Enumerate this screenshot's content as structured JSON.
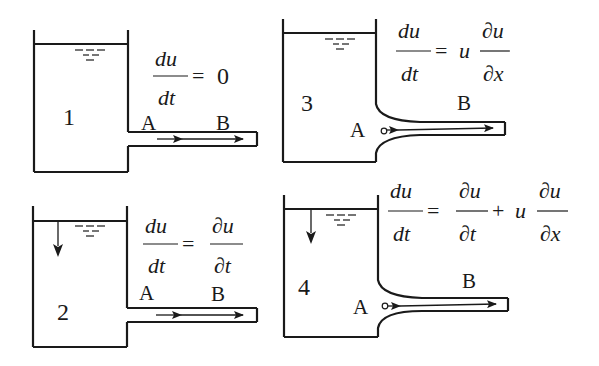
{
  "diagrams": [
    {
      "number": "1",
      "label_a": "A",
      "label_b": "B",
      "equation": {
        "lhs_num": "du",
        "lhs_den": "dt",
        "equals": "=",
        "rhs": "0"
      },
      "tank_level": "constant",
      "pipe": "uniform"
    },
    {
      "number": "2",
      "label_a": "A",
      "label_b": "B",
      "equation": {
        "lhs_num": "du",
        "lhs_den": "dt",
        "equals": "=",
        "rhs_num": "∂u",
        "rhs_den": "∂t"
      },
      "tank_level": "falling",
      "pipe": "uniform"
    },
    {
      "number": "3",
      "label_a": "A",
      "label_b": "B",
      "equation": {
        "lhs_num": "du",
        "lhs_den": "dt",
        "equals": "=",
        "coef": "u",
        "rhs_num": "∂u",
        "rhs_den": "∂x"
      },
      "tank_level": "constant",
      "pipe": "converging"
    },
    {
      "number": "4",
      "label_a": "A",
      "label_b": "B",
      "equation": {
        "lhs_num": "du",
        "lhs_den": "dt",
        "equals": "=",
        "rhs1_num": "∂u",
        "rhs1_den": "∂t",
        "plus": "+",
        "coef": "u",
        "rhs2_num": "∂u",
        "rhs2_den": "∂x"
      },
      "tank_level": "falling",
      "pipe": "converging"
    }
  ],
  "colors": {
    "stroke": "#1a1a1a",
    "background": "#ffffff"
  }
}
